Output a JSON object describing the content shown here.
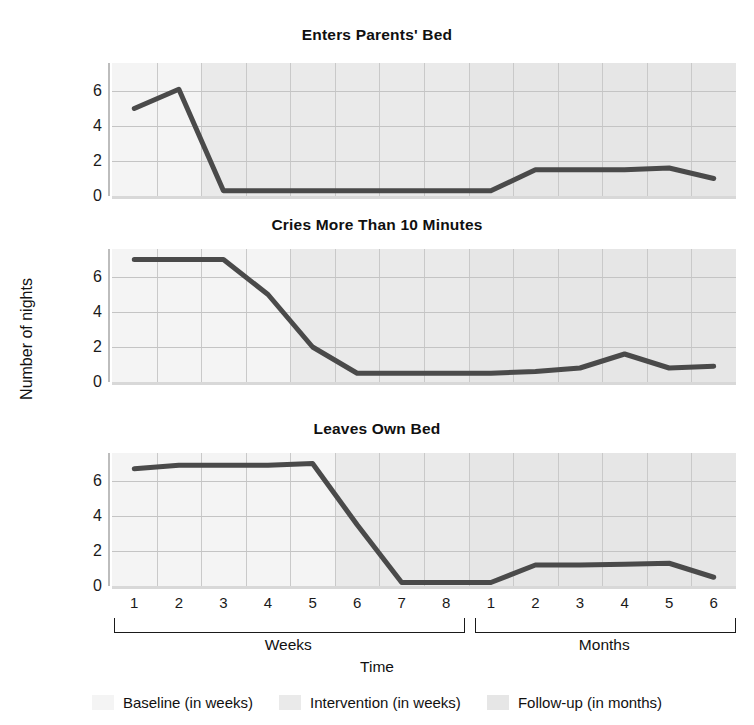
{
  "figure": {
    "y_axis_title": "Number of nights",
    "x_axis_title": "Time",
    "group_labels": [
      "Weeks",
      "Months"
    ]
  },
  "legend": {
    "items": [
      {
        "label": "Baseline (in weeks)",
        "color": "#f4f4f4",
        "name": "baseline"
      },
      {
        "label": "Intervention (in weeks)",
        "color": "#eaeaea",
        "name": "intervention"
      },
      {
        "label": "Follow-up (in months)",
        "color": "#e6e6e6",
        "name": "followup"
      }
    ]
  },
  "chart_data": [
    {
      "type": "line",
      "title": "Enters Parents' Bed",
      "xlabel": "Time",
      "ylabel": "Number of nights",
      "ylim": [
        0,
        7.6
      ],
      "yticks": [
        0,
        2,
        4,
        6
      ],
      "grid": true,
      "categories": [
        "W1",
        "W2",
        "W3",
        "W4",
        "W5",
        "W6",
        "W7",
        "W8",
        "M1",
        "M2",
        "M3",
        "M4",
        "M5",
        "M6"
      ],
      "x_tick_labels": [
        "1",
        "2",
        "3",
        "4",
        "5",
        "6",
        "7",
        "8",
        "1",
        "2",
        "3",
        "4",
        "5",
        "6"
      ],
      "values": [
        5.0,
        6.1,
        0.3,
        0.3,
        0.3,
        0.3,
        0.3,
        0.3,
        0.3,
        1.5,
        1.5,
        1.5,
        1.6,
        1.0
      ],
      "phase_breaks": {
        "baseline_end_index": 2,
        "intervention_end_index": 7
      },
      "line_color": "#4a4a4a",
      "line_width": 5
    },
    {
      "type": "line",
      "title": "Cries More Than 10 Minutes",
      "xlabel": "Time",
      "ylabel": "Number of nights",
      "ylim": [
        0,
        7.6
      ],
      "yticks": [
        0,
        2,
        4,
        6
      ],
      "grid": true,
      "categories": [
        "W1",
        "W2",
        "W3",
        "W4",
        "W5",
        "W6",
        "W7",
        "W8",
        "M1",
        "M2",
        "M3",
        "M4",
        "M5",
        "M6"
      ],
      "x_tick_labels": [
        "1",
        "2",
        "3",
        "4",
        "5",
        "6",
        "7",
        "8",
        "1",
        "2",
        "3",
        "4",
        "5",
        "6"
      ],
      "values": [
        7.0,
        7.0,
        7.0,
        5.0,
        2.0,
        0.5,
        0.5,
        0.5,
        0.5,
        0.6,
        0.8,
        1.6,
        0.8,
        0.9
      ],
      "phase_breaks": {
        "baseline_end_index": 4,
        "intervention_end_index": 7
      },
      "line_color": "#4a4a4a",
      "line_width": 5
    },
    {
      "type": "line",
      "title": "Leaves Own Bed",
      "xlabel": "Time",
      "ylabel": "Number of nights",
      "ylim": [
        0,
        7.6
      ],
      "yticks": [
        0,
        2,
        4,
        6
      ],
      "grid": true,
      "categories": [
        "W1",
        "W2",
        "W3",
        "W4",
        "W5",
        "W6",
        "W7",
        "W8",
        "M1",
        "M2",
        "M3",
        "M4",
        "M5",
        "M6"
      ],
      "x_tick_labels": [
        "1",
        "2",
        "3",
        "4",
        "5",
        "6",
        "7",
        "8",
        "1",
        "2",
        "3",
        "4",
        "5",
        "6"
      ],
      "values": [
        6.7,
        6.9,
        6.9,
        6.9,
        7.0,
        3.5,
        0.2,
        0.2,
        0.2,
        1.2,
        1.2,
        1.25,
        1.3,
        0.5
      ],
      "phase_breaks": {
        "baseline_end_index": 5,
        "intervention_end_index": 7
      },
      "line_color": "#4a4a4a",
      "line_width": 5
    }
  ]
}
